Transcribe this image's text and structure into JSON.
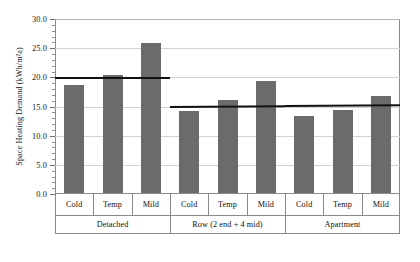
{
  "chart_data": {
    "type": "bar",
    "title": "",
    "xlabel": "",
    "ylabel": "Space Heating Demand (kWh/m²a)",
    "ylim": [
      0.0,
      30.0
    ],
    "ytick_step": 5.0,
    "yminor_step": 1.0,
    "grid": true,
    "legend": "none",
    "bar_color": "#6b6b6b",
    "refline_color": "#111111",
    "grid_color": "#d2d2d2",
    "axis_color": "#8a8a8a",
    "ytick_labels": [
      "30.0",
      "25.0",
      "20.0",
      "15.0",
      "10.0",
      "5.0",
      "0.0"
    ],
    "ytick_values": [
      30.0,
      25.0,
      20.0,
      15.0,
      10.0,
      5.0,
      0.0
    ],
    "categories": [
      "Cold",
      "Temp",
      "Mild"
    ],
    "groups": [
      {
        "label": "Detached",
        "values": [
          18.5,
          20.2,
          25.7
        ],
        "reference_line": {
          "start": 20.1,
          "end": 20.1
        }
      },
      {
        "label": "Row (2 end + 4 mid)",
        "values": [
          14.1,
          16.0,
          19.2
        ],
        "reference_line": {
          "start": 15.15,
          "end": 15.28
        }
      },
      {
        "label": "Apartment",
        "values": [
          13.2,
          14.3,
          16.6
        ],
        "reference_line": {
          "start": 15.28,
          "end": 15.4
        }
      }
    ],
    "annotations": [
      "Horizontal reference line at 20.1 kWh/m²a across the Detached group",
      "Horizontal reference line near 15.2–15.4 kWh/m²a spanning the Row and Apartment groups"
    ]
  }
}
